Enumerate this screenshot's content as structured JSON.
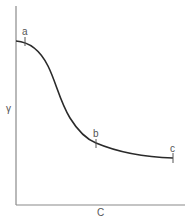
{
  "diagram": {
    "type": "curve",
    "x_axis_label": "C",
    "y_axis_label": "γ",
    "points": [
      {
        "label": "a",
        "x": 25,
        "y": 41
      },
      {
        "label": "b",
        "x": 96,
        "y": 143
      },
      {
        "label": "c",
        "x": 173,
        "y": 158
      }
    ],
    "colors": {
      "axis": "#8a8a8a",
      "curve": "#2a2a2a",
      "label": "#555555",
      "background": "#ffffff"
    }
  }
}
